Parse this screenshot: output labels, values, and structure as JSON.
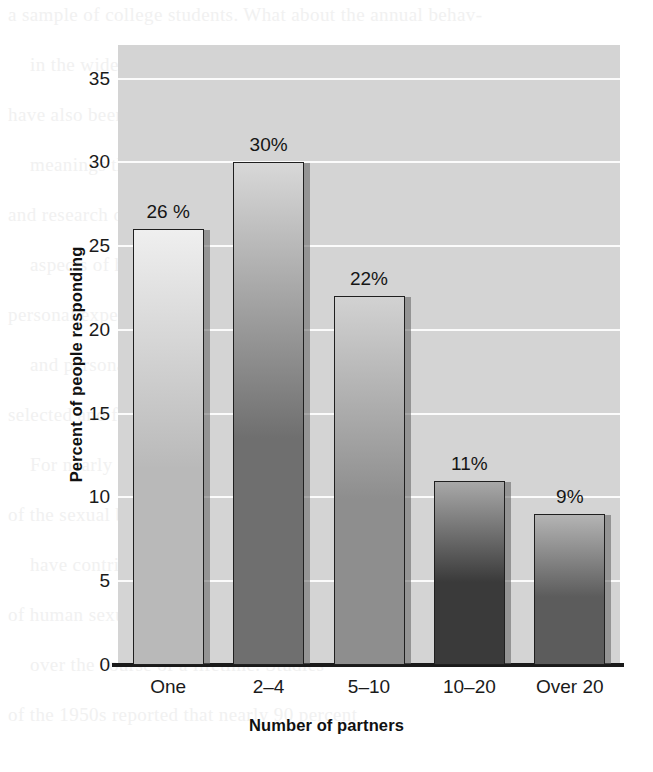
{
  "chart_data": {
    "type": "bar",
    "title": "",
    "xlabel": "Number of partners",
    "ylabel": "Percent of people responding",
    "categories": [
      "One",
      "2–4",
      "5–10",
      "10–20",
      "Over 20"
    ],
    "values": [
      26,
      30,
      22,
      11,
      9
    ],
    "data_labels": [
      "26 %",
      "30%",
      "22%",
      "11%",
      "9%"
    ],
    "ylim": [
      0,
      37
    ],
    "yticks": [
      0,
      5,
      10,
      15,
      20,
      25,
      30,
      35
    ],
    "ytick_labels": [
      "0",
      "5",
      "10",
      "15",
      "20",
      "25",
      "30",
      "35"
    ],
    "grid": true,
    "legend": false,
    "bar_colors": [
      "#b9b9b9",
      "#6f6f6f",
      "#8e8e8e",
      "#3a3a3a",
      "#5c5c5c"
    ],
    "bar_colors_top": [
      "#efefef",
      "#d8d8d8",
      "#d2d2d2",
      "#a8a8a8",
      "#b4b4b4"
    ],
    "plot_background": "#d4d4d4",
    "gridline_color": "#fbfbfb",
    "axis_color": "#1a1a1a"
  },
  "bleed_text": {
    "lines": [
      "a sample of college students. What about the annual behav-",
      "in the wider world. Anthropologist Scientific",
      "have also been found to affect our attitudes",
      "meanings they are based on the assumptions",
      "and research on sexuality from our culture are",
      "aspects of human sexual expression",
      "personal experience",
      "and personal feelings",
      "selected and formed",
      "For nearly fifty years, many studies",
      "of the sexual behavior of men and women",
      "have contributed to our understanding",
      "of human sexuality and how it develops",
      "over the course of a lifetime. Studies",
      "of the 1950s reported that nearly 90 percent"
    ]
  }
}
